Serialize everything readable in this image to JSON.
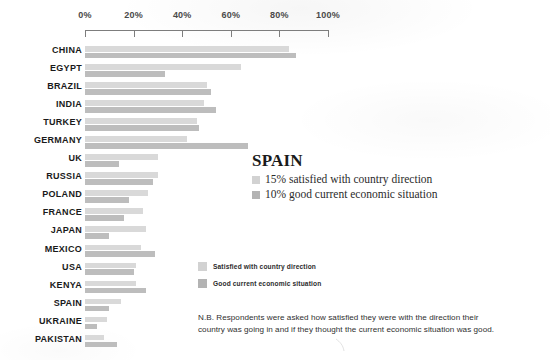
{
  "chart_data": {
    "type": "bar",
    "orientation": "horizontal",
    "title": "",
    "xlabel": "",
    "ylabel": "",
    "xlim": [
      0,
      100
    ],
    "xticks": [
      "0%",
      "20%",
      "40%",
      "60%",
      "80%",
      "100%"
    ],
    "xtick_values": [
      0,
      20,
      40,
      60,
      80,
      100
    ],
    "grid": false,
    "axis_position": "top",
    "legend_position": "center-right",
    "categories": [
      "CHINA",
      "EGYPT",
      "BRAZIL",
      "INDIA",
      "TURKEY",
      "GERMANY",
      "UK",
      "RUSSIA",
      "POLAND",
      "FRANCE",
      "JAPAN",
      "MEXICO",
      "USA",
      "KENYA",
      "SPAIN",
      "UKRAINE",
      "PAKISTAN"
    ],
    "series": [
      {
        "name": "Satisfied with country direction",
        "color": "#d9d9d9",
        "values": [
          84,
          64,
          50,
          49,
          46,
          42,
          30,
          30,
          26,
          24,
          25,
          23,
          21,
          21,
          15,
          9,
          8
        ]
      },
      {
        "name": "Good current economic situation",
        "color": "#bdbdbd",
        "values": [
          87,
          33,
          52,
          54,
          47,
          67,
          14,
          28,
          18,
          16,
          10,
          29,
          20,
          25,
          10,
          5,
          13
        ]
      }
    ]
  },
  "callout": {
    "title": "SPAIN",
    "lines": [
      {
        "swatch": "light",
        "text": "15% satisfied with country direction"
      },
      {
        "swatch": "dark",
        "text": "10% good current economic situation"
      }
    ]
  },
  "legend": {
    "items": [
      {
        "swatch": "light",
        "label": "Satisfied with country direction"
      },
      {
        "swatch": "dark",
        "label": "Good current economic situation"
      }
    ]
  },
  "footnote": {
    "line1": "N.B. Respondents were asked how satisfied they were with the direction their",
    "line2": "country was going in and if they thought the current economic situation was good."
  },
  "colors": {
    "light_bar": "#d9d9d9",
    "dark_bar": "#bdbdbd",
    "axis": "#7d7d7d",
    "text": "#231f20",
    "background": "#ffffff"
  }
}
